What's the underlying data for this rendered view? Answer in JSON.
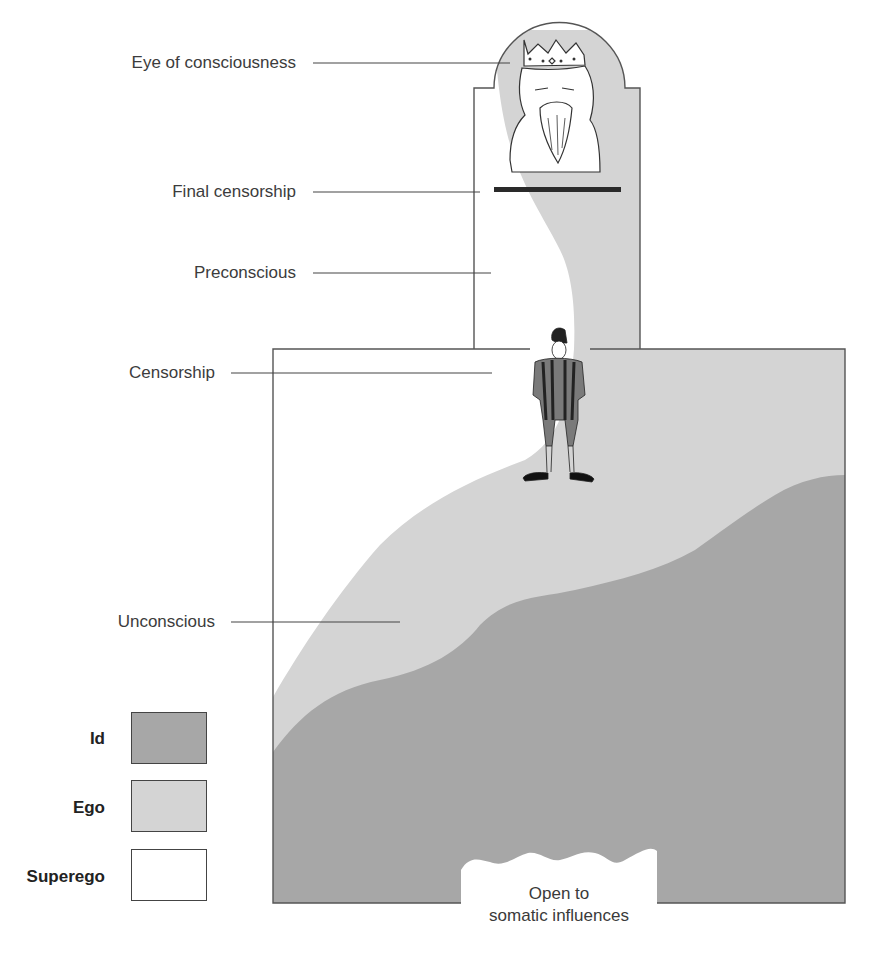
{
  "diagram": {
    "labels": {
      "eye_of_consciousness": "Eye of consciousness",
      "final_censorship": "Final censorship",
      "preconscious": "Preconscious",
      "censorship": "Censorship",
      "unconscious": "Unconscious"
    },
    "bottom_opening": {
      "line1": "Open to",
      "line2": "somatic influences"
    },
    "figures": {
      "king": "crowned-king-icon",
      "guard": "guard-figure-icon"
    }
  },
  "legend": {
    "items": [
      {
        "label": "Id",
        "color": "#a7a7a7"
      },
      {
        "label": "Ego",
        "color": "#d4d4d4"
      },
      {
        "label": "Superego",
        "color": "#ffffff"
      }
    ]
  },
  "colors": {
    "id": "#a7a7a7",
    "ego": "#d4d4d4",
    "superego": "#ffffff",
    "outline": "#555555",
    "censor_bar": "#2a2a2a"
  }
}
